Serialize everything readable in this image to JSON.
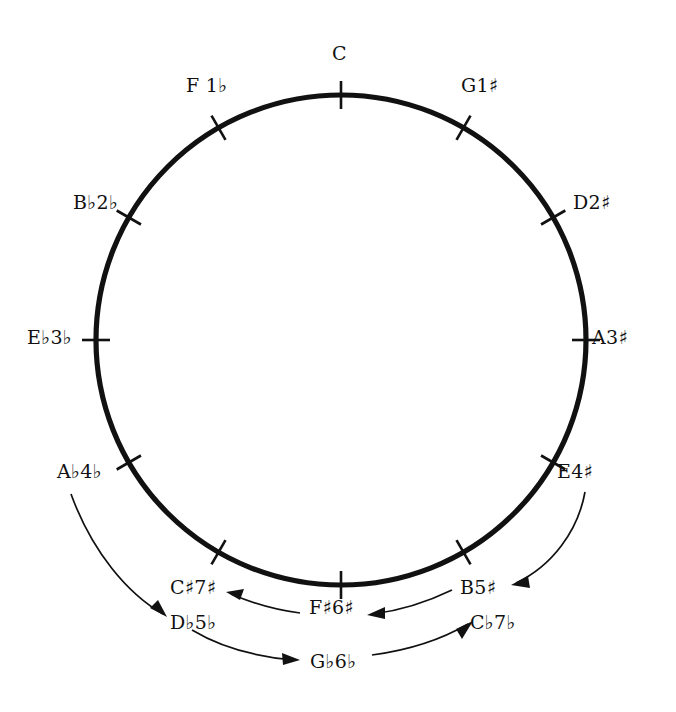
{
  "figure": {
    "background_color": "#ffffff",
    "ink_color": "#111111"
  },
  "chart_data": {
    "type": "scatter",
    "xlabel": "",
    "ylabel": "",
    "grid": false,
    "legend": "none",
    "geometry": {
      "center_x": 341,
      "center_y": 340,
      "radius": 245,
      "tick_count": 12,
      "tick_spacing_degrees": 30
    },
    "categories": [
      "C",
      "G",
      "D",
      "A",
      "E",
      "B",
      "F#",
      "C#",
      "Ab",
      "Eb",
      "Bb",
      "F"
    ],
    "values": [
      0,
      1,
      2,
      3,
      4,
      5,
      6,
      7,
      4,
      3,
      2,
      1
    ],
    "annotations": [
      "Sharp keys run clockwise from C; flat keys run counter-clockwise from C.",
      "Arrows connect enharmonically equivalent spellings at the bottom of the circle."
    ]
  },
  "circle_nodes": [
    {
      "id": "c",
      "key": "C",
      "accidental_count": "",
      "accidental": "",
      "angle_deg": 0,
      "label": "C"
    },
    {
      "id": "g",
      "key": "G",
      "accidental_count": "1",
      "accidental": "♯",
      "angle_deg": 30,
      "label": "G1♯"
    },
    {
      "id": "d",
      "key": "D",
      "accidental_count": "2",
      "accidental": "♯",
      "angle_deg": 60,
      "label": "D2♯"
    },
    {
      "id": "a",
      "key": "A",
      "accidental_count": "3",
      "accidental": "♯",
      "angle_deg": 90,
      "label": "A3♯"
    },
    {
      "id": "e",
      "key": "E",
      "accidental_count": "4",
      "accidental": "♯",
      "angle_deg": 120,
      "label": "E4♯"
    },
    {
      "id": "b",
      "key": "B",
      "accidental_count": "5",
      "accidental": "♯",
      "angle_deg": 150,
      "label": "B5♯"
    },
    {
      "id": "fs",
      "key": "F♯",
      "accidental_count": "6",
      "accidental": "♯",
      "angle_deg": 180,
      "label": "F♯6♯"
    },
    {
      "id": "cs",
      "key": "C♯",
      "accidental_count": "7",
      "accidental": "♯",
      "angle_deg": 210,
      "label": "C♯7♯"
    },
    {
      "id": "ab",
      "key": "A♭",
      "accidental_count": "4",
      "accidental": "♭",
      "angle_deg": 240,
      "label": "A♭4♭"
    },
    {
      "id": "eb",
      "key": "E♭",
      "accidental_count": "3",
      "accidental": "♭",
      "angle_deg": 270,
      "label": "E♭3♭"
    },
    {
      "id": "bb",
      "key": "B♭",
      "accidental_count": "2",
      "accidental": "♭",
      "angle_deg": 300,
      "label": "B♭2♭"
    },
    {
      "id": "f",
      "key": "F",
      "accidental_count": "1",
      "accidental": "♭",
      "angle_deg": 330,
      "label": "F 1♭"
    }
  ],
  "labels": {
    "c": {
      "text": "C",
      "x": 332,
      "y": 44
    },
    "g": {
      "text": "G1♯",
      "x": 461,
      "y": 76
    },
    "d": {
      "text": "D2♯",
      "x": 573,
      "y": 193
    },
    "a": {
      "text": "A3♯",
      "x": 592,
      "y": 328
    },
    "e": {
      "text": "E4♯",
      "x": 557,
      "y": 462
    },
    "b": {
      "text": "B5♯",
      "x": 460,
      "y": 578
    },
    "fs": {
      "text": "F♯6♯",
      "x": 309,
      "y": 598
    },
    "cs": {
      "text": "C♯7♯",
      "x": 170,
      "y": 578
    },
    "ab": {
      "text": "A♭4♭",
      "x": 57,
      "y": 462
    },
    "eb": {
      "text": "E♭3♭",
      "x": 27,
      "y": 328
    },
    "bb": {
      "text": "B♭2♭",
      "x": 73,
      "y": 193
    },
    "f": {
      "text": "F 1♭",
      "x": 186,
      "y": 76
    },
    "db": {
      "text": "D♭5♭",
      "x": 170,
      "y": 613
    },
    "gb": {
      "text": "G♭6♭",
      "x": 310,
      "y": 652
    },
    "cb": {
      "text": "C♭7♭",
      "x": 470,
      "y": 613
    }
  },
  "enharmonic_nodes": [
    {
      "id": "db",
      "key": "D♭",
      "accidental_count": "5",
      "accidental": "♭",
      "label": "D♭5♭",
      "equivalent_of": "C♯"
    },
    {
      "id": "gb",
      "key": "G♭",
      "accidental_count": "6",
      "accidental": "♭",
      "label": "G♭6♭",
      "equivalent_of": "F♯"
    },
    {
      "id": "cb",
      "key": "C♭",
      "accidental_count": "7",
      "accidental": "♭",
      "label": "C♭7♭",
      "equivalent_of": "B"
    }
  ],
  "arrows": [
    {
      "id": "ab-to-db",
      "from": "A♭4♭",
      "to": "D♭5♭",
      "direction": "down-right"
    },
    {
      "id": "e-to-b",
      "from": "E4♯",
      "to": "B5♯",
      "direction": "down-left"
    },
    {
      "id": "fs-to-cs",
      "from": "F♯6♯",
      "to": "C♯7♯",
      "direction": "left"
    },
    {
      "id": "b-to-fs",
      "from": "B5♯",
      "to": "F♯6♯",
      "direction": "left"
    },
    {
      "id": "db-to-gb",
      "from": "D♭5♭",
      "to": "G♭6♭",
      "direction": "right"
    },
    {
      "id": "gb-to-cb",
      "from": "G♭6♭",
      "to": "C♭7♭",
      "direction": "right"
    }
  ]
}
